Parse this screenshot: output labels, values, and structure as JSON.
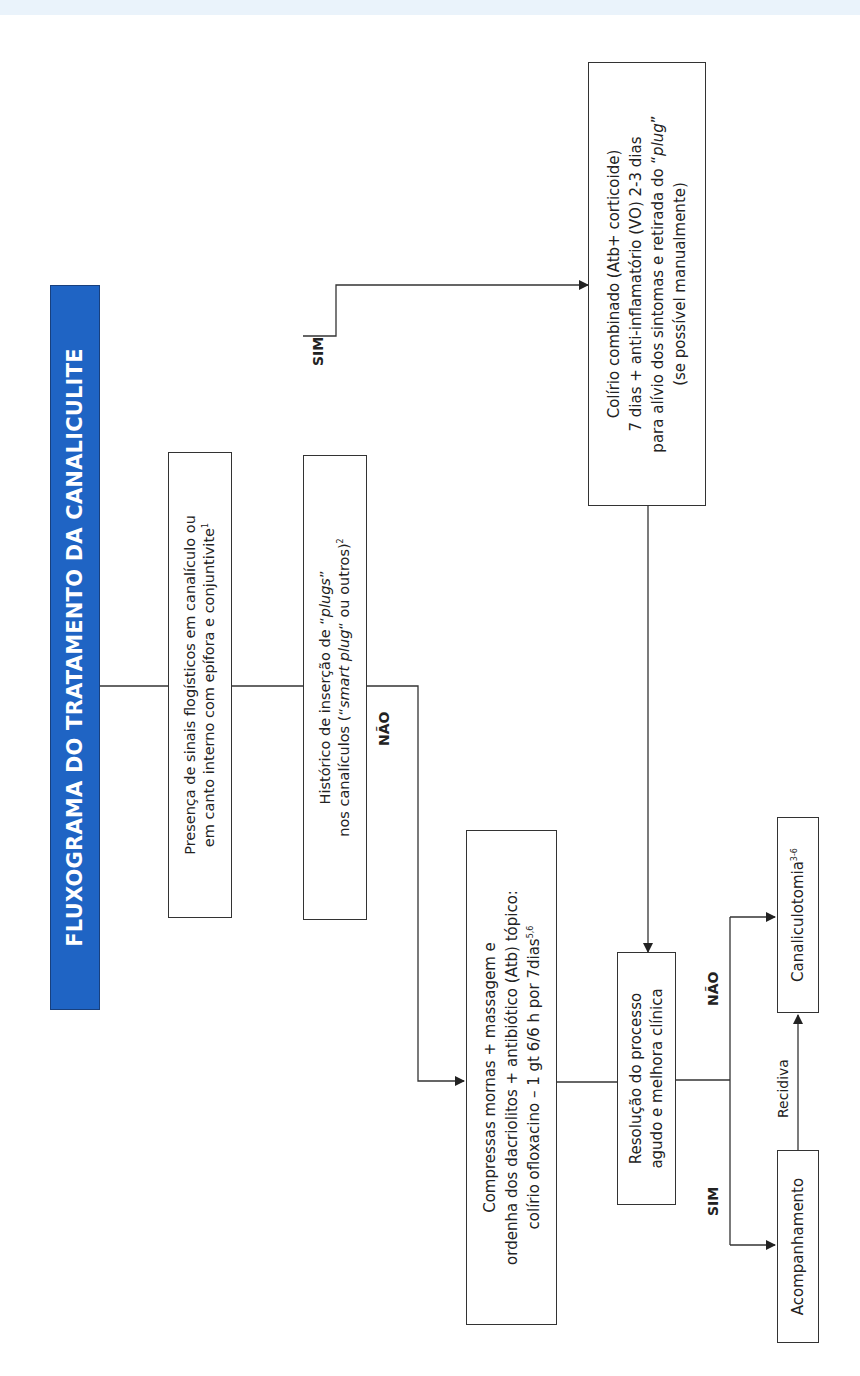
{
  "title": "FLUXOGRAMA DO TRATAMENTO DA CANALICULITE",
  "colors": {
    "title_bg": "#1f64c4",
    "title_text": "#ffffff",
    "line": "#333333",
    "top_band": "#eaf3fb"
  },
  "nodes": {
    "presenca": {
      "lines": [
        "Presença de sinais flogísticos em canalículo ou",
        "em canto interno com epífora e conjuntivite"
      ],
      "ref": "1"
    },
    "historico": {
      "line1_pre": "Histórico de inserção de “",
      "line1_em": "plugs",
      "line1_post": "”",
      "line2_pre": "nos canalículos (“",
      "line2_em": "smart plug",
      "line2_post": "“ ou outros)",
      "ref": "2"
    },
    "colirio_combinado": {
      "lines": [
        "Colírio combinado (Atb+ corticoide)",
        "7 dias + anti-inflamatório (VO) 2-3 dias"
      ],
      "line3_pre": "para alívio dos sintomas e retirada do “",
      "line3_em": "plug",
      "line3_post": "”",
      "line4": "(se possível manualmente)"
    },
    "compressas": {
      "lines": [
        "Compressas mornas + massagem e",
        "ordenha dos dacriolitos + antibiótico (Atb) tópico:",
        "colírio ofloxacino – 1 gt 6/6 h por 7dias"
      ],
      "ref": "5,6"
    },
    "resolucao": {
      "lines": [
        "Resolução do processo",
        "agudo e melhora clínica"
      ]
    },
    "acompanhamento": {
      "label": "Acompanhamento"
    },
    "canaliculotomia": {
      "label": "Canaliculotomia",
      "ref": "3-6"
    }
  },
  "edge_labels": {
    "historico_sim": "SIM",
    "historico_nao": "NÃO",
    "resolucao_sim": "SIM",
    "resolucao_nao": "NÃO",
    "recidiva": "Recidiva"
  }
}
